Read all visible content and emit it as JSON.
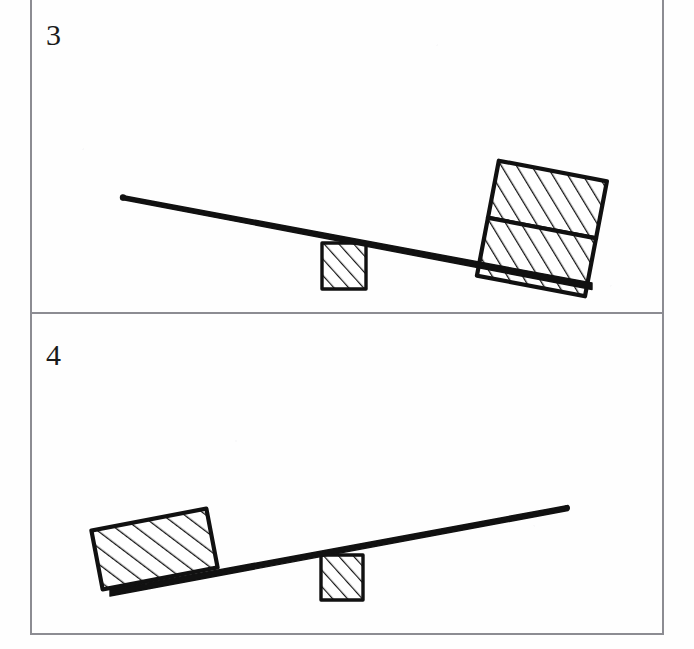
{
  "figure": {
    "background_color": "#fefefe",
    "ink_color": "#111111",
    "border_color": "#8c8c92"
  },
  "panels": [
    {
      "number": "3",
      "number_position": {
        "x": 46,
        "y": 20
      },
      "bounds": {
        "x": 31,
        "y": -6,
        "width": 632,
        "height": 319
      },
      "lever": {
        "name": "lever-bar",
        "left_end": {
          "x": 122,
          "y": 197
        },
        "right_end": {
          "x": 592,
          "y": 286
        },
        "thickness": 6,
        "tilt": "down-to-the-right"
      },
      "fulcrum": {
        "name": "fulcrum-block",
        "x": 322,
        "y": 243,
        "width": 44,
        "height": 46,
        "fill": "diagonal-hatch",
        "units": 1
      },
      "load": {
        "name": "load-blocks",
        "units": 2,
        "stacked": true,
        "x": 487,
        "y": 170,
        "width": 110,
        "height": 117,
        "rotation_deg": 10.8,
        "fill": "diagonal-hatch"
      }
    },
    {
      "number": "4",
      "number_position": {
        "x": 46,
        "y": 340
      },
      "bounds": {
        "x": 31,
        "y": 313,
        "width": 632,
        "height": 321
      },
      "lever": {
        "name": "lever-bar",
        "left_end": {
          "x": 110,
          "y": 593
        },
        "right_end": {
          "x": 568,
          "y": 507
        },
        "thickness": 6,
        "tilt": "up-to-the-right"
      },
      "fulcrum": {
        "name": "fulcrum-block",
        "x": 321,
        "y": 555,
        "width": 42,
        "height": 45,
        "fill": "diagonal-hatch",
        "units": 1
      },
      "load": {
        "name": "load-block",
        "units": 1,
        "stacked": false,
        "x": 96,
        "y": 519,
        "width": 117,
        "height": 60,
        "rotation_deg": -10.8,
        "fill": "diagonal-hatch"
      }
    }
  ]
}
